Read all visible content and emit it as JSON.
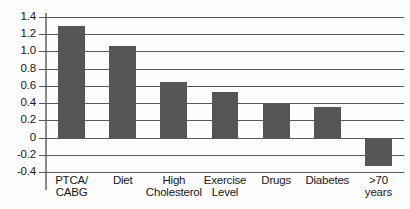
{
  "chart_data": {
    "type": "bar",
    "title": "",
    "subtitle": "",
    "xlabel": "",
    "ylabel": "",
    "categories": [
      "PTCA/\nCABG",
      "Diet",
      "High\nCholesterol",
      "Exercise\nLevel",
      "Drugs",
      "Diabetes",
      ">70\nyears"
    ],
    "values": [
      1.29,
      1.06,
      0.65,
      0.53,
      0.39,
      0.35,
      -0.33
    ],
    "ylim": [
      -0.4,
      1.4
    ],
    "ytick_labels": [
      "1.4",
      "1.2",
      "1.0",
      "0.8",
      "0.6",
      "0.4",
      "0.2",
      "0",
      "-0.2",
      "-0.4"
    ],
    "ytick_values": [
      1.4,
      1.2,
      1.0,
      0.8,
      0.6,
      0.4,
      0.2,
      0,
      -0.2,
      -0.4
    ],
    "grid": true,
    "legend": false,
    "legend_position": "none",
    "bar_color": "#565656",
    "axis_color": "#5a5a5a",
    "background_color": "#ffffff",
    "text_color": "#17171a"
  }
}
